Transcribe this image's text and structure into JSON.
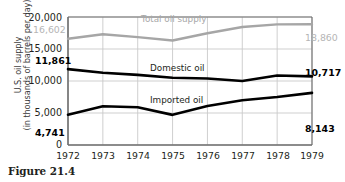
{
  "figure": {
    "caption": "Figure 21.4"
  },
  "axes": {
    "y_title_line1": "U.S. oil supply",
    "y_title_line2": "(in thousands of barrels per day)",
    "y_ticks": [
      "20,000",
      "15,000",
      "10,000",
      "5,000",
      "0"
    ],
    "x_ticks": [
      "1972",
      "1973",
      "1974",
      "1975",
      "1976",
      "1977",
      "1978",
      "1979"
    ]
  },
  "series_labels": {
    "total": "Total oil supply",
    "domestic": "Domestic oil",
    "imported": "Imported oil"
  },
  "endpoint_labels": {
    "total_start": "16,602",
    "total_end": "18,860",
    "domestic_start": "11,861",
    "domestic_end": "10,717",
    "imported_start": "4,741",
    "imported_end": "8,143"
  },
  "colors": {
    "total_line": "#a6a6a6",
    "domestic_line": "#000000",
    "imported_line": "#000000",
    "grid": "#c9c9c9",
    "axis": "#6e6e6e",
    "text": "#231f20",
    "gray_text": "#b0b0b0"
  },
  "chart_data": {
    "type": "line",
    "title": "",
    "xlabel": "",
    "ylabel": "U.S. oil supply (in thousands of barrels per day)",
    "x": [
      1972,
      1973,
      1974,
      1975,
      1976,
      1977,
      1978,
      1979
    ],
    "ylim": [
      0,
      20000
    ],
    "yticks": [
      0,
      5000,
      10000,
      15000,
      20000
    ],
    "grid": true,
    "legend": "inline-labels",
    "series": [
      {
        "name": "Total oil supply",
        "color": "#a6a6a6",
        "values": [
          16602,
          17308,
          16853,
          16322,
          17461,
          18431,
          18847,
          18860
        ]
      },
      {
        "name": "Domestic oil",
        "color": "#000000",
        "values": [
          11861,
          11300,
          10950,
          10510,
          10400,
          10010,
          10850,
          10717
        ]
      },
      {
        "name": "Imported oil",
        "color": "#000000",
        "values": [
          4741,
          6050,
          5900,
          4710,
          6100,
          7000,
          7500,
          8143
        ]
      }
    ]
  }
}
